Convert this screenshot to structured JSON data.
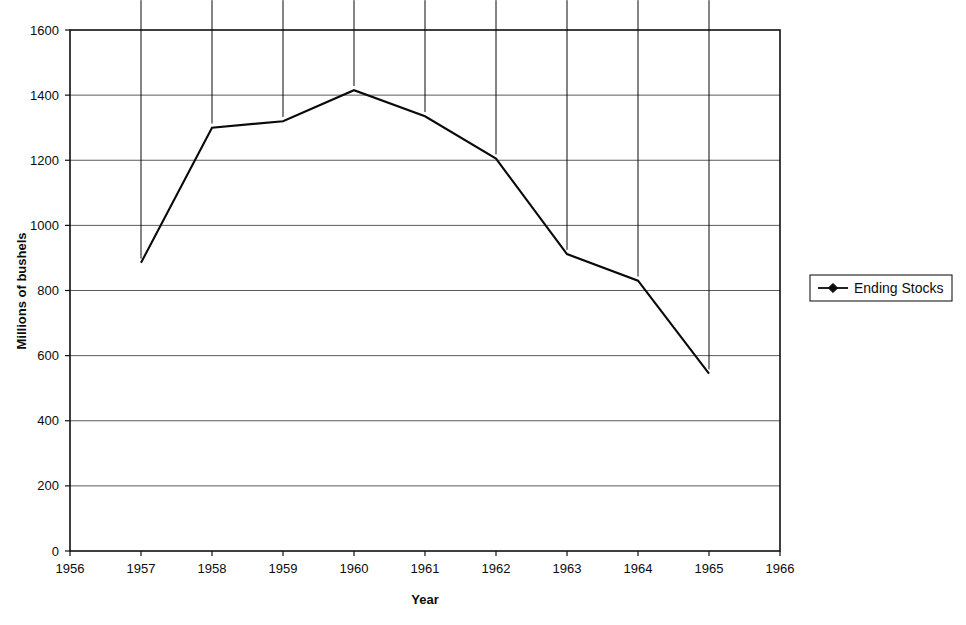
{
  "chart_data": {
    "type": "line",
    "title": "",
    "subtitle": "",
    "xlabel": "Year",
    "ylabel": "Millions of bushels",
    "x": [
      1957,
      1958,
      1959,
      1960,
      1961,
      1962,
      1963,
      1964,
      1965
    ],
    "series": [
      {
        "name": "Ending Stocks",
        "values": [
          885,
          1300,
          1320,
          1415,
          1335,
          1205,
          912,
          830,
          545
        ],
        "marker": "diamond",
        "color": "#0a0a0a"
      }
    ],
    "xlim": [
      1956,
      1966
    ],
    "ylim": [
      0,
      1600
    ],
    "xticks": [
      1956,
      1957,
      1958,
      1959,
      1960,
      1961,
      1962,
      1963,
      1964,
      1965,
      1966
    ],
    "xtick_labels": [
      "1956",
      "1957",
      "1958",
      "1959",
      "1960",
      "1961",
      "1962",
      "1963",
      "1964",
      "1965",
      "1966"
    ],
    "yticks": [
      0,
      200,
      400,
      600,
      800,
      1000,
      1200,
      1400,
      1600
    ],
    "ytick_labels": [
      "0",
      "200",
      "400",
      "600",
      "800",
      "1000",
      "1200",
      "1400",
      "1600"
    ],
    "grid": "horizontal",
    "legend_position": "right",
    "legend_entries": [
      "Ending Stocks"
    ]
  },
  "legend": {
    "entry_label": "Ending Stocks",
    "marker_icon": "diamond-marker-icon"
  },
  "axes": {
    "y_title": "Millions of bushels",
    "x_title": "Year"
  },
  "colors": {
    "line": "#0a0a0a",
    "grid": "#4a4a4a",
    "frame": "#101010",
    "background": "#ffffff"
  }
}
